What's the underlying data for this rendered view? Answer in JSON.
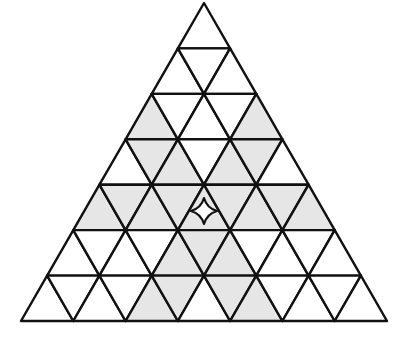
{
  "diagram": {
    "type": "triangular-grid",
    "rows": 7,
    "apex": [
      204,
      3
    ],
    "base_left": [
      21,
      321
    ],
    "base_right": [
      387,
      321
    ],
    "colors": {
      "line": "#111111",
      "shaded": "#e6e6e6",
      "unshaded": "#ffffff",
      "star_fill": "#ffffff"
    },
    "shading_by_row": [
      [
        0
      ],
      [
        0,
        0,
        0
      ],
      [
        1,
        0,
        0,
        0,
        1
      ],
      [
        0,
        1,
        1,
        0,
        1,
        1,
        0
      ],
      [
        1,
        1,
        1,
        1,
        1,
        1,
        1,
        1,
        1
      ],
      [
        0,
        0,
        0,
        0,
        1,
        1,
        1,
        0,
        0,
        0,
        0
      ],
      [
        0,
        0,
        0,
        0,
        1,
        1,
        0,
        1,
        1,
        0,
        0,
        0,
        0
      ]
    ],
    "marker": {
      "shape": "four-pointed-star",
      "row": 4,
      "index": 4,
      "center": [
        204,
        211
      ],
      "size": 26
    }
  }
}
